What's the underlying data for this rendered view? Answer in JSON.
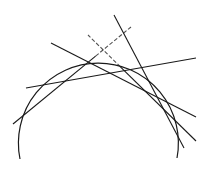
{
  "diagram": {
    "type": "circle-with-tangent-lines",
    "background": "#ffffff",
    "stroke_color": "#1a1a1a",
    "arc": {
      "start": [
        20,
        159
      ],
      "end": [
        177,
        158
      ],
      "radius": 80,
      "stroke_width": 1.2
    },
    "lines": [
      {
        "id": "tangent-1",
        "x1": 13,
        "y1": 124,
        "x2": 131,
        "y2": 27,
        "dashed_top": true
      },
      {
        "id": "tangent-2",
        "x1": 26,
        "y1": 88,
        "x2": 196,
        "y2": 58,
        "dashed_top": false
      },
      {
        "id": "tangent-3",
        "x1": 51,
        "y1": 43,
        "x2": 196,
        "y2": 117,
        "dashed_top": false
      },
      {
        "id": "tangent-4",
        "x1": 88,
        "y1": 35,
        "x2": 196,
        "y2": 141,
        "dashed_top": true
      },
      {
        "id": "tangent-5",
        "x1": 114,
        "y1": 15,
        "x2": 184,
        "y2": 148,
        "dashed_top": false
      }
    ]
  }
}
